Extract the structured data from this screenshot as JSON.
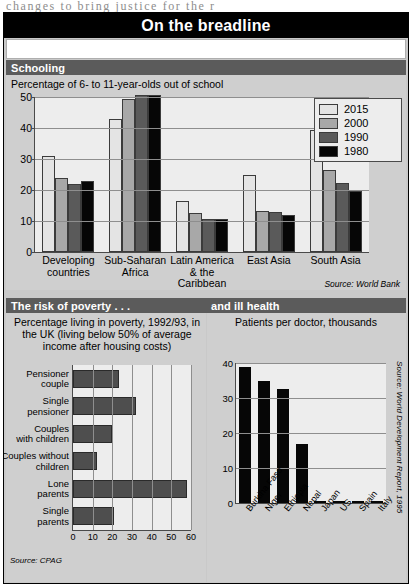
{
  "page": {
    "bleed_text": "changes to bring justice for the r"
  },
  "masthead": {
    "title": "On the breadline"
  },
  "sections": {
    "schooling": {
      "band_label": "Schooling",
      "subtitle": "Percentage of 6- to 11-year-olds out of school",
      "source": "Source: World Bank"
    },
    "poverty": {
      "band_label": "The risk of poverty . . .",
      "subtitle": "Percentage living in poverty, 1992/93, in the UK (living below 50% of average income after housing costs)",
      "source": "Source: CPAG"
    },
    "health": {
      "band_label": "and ill health",
      "subtitle": "Patients per doctor, thousands",
      "source": "Source: World Development Report, 1995"
    }
  },
  "colors": {
    "series_2015": "#e4e4e4",
    "series_2000": "#a8a8a8",
    "series_1990": "#5a5a5a",
    "series_1980": "#060606",
    "bar_dark": "#4e4e4e",
    "bar_black": "#060606",
    "band_gray": "#5b5b5b",
    "panel_gray": "#cfcfcf",
    "plot_gray": "#ededed"
  },
  "chart_data": [
    {
      "id": "schooling",
      "type": "bar",
      "title": "Percentage of 6- to 11-year-olds out of school",
      "xlabel": "",
      "ylabel": "",
      "ylim": [
        0,
        50
      ],
      "yticks": [
        0,
        10,
        20,
        30,
        40,
        50
      ],
      "grid": true,
      "legend_position": "top-right",
      "categories": [
        "Developing countries",
        "Sub-Saharan Africa",
        "Latin America & the Caribbean",
        "East Asia",
        "South Asia"
      ],
      "series": [
        {
          "name": "2015",
          "color": "#e4e4e4",
          "values": [
            31.0,
            43.0,
            16.5,
            25.0,
            39.5
          ]
        },
        {
          "name": "2000",
          "color": "#a8a8a8",
          "values": [
            23.8,
            49.5,
            12.7,
            13.2,
            26.3
          ]
        },
        {
          "name": "1990",
          "color": "#5a5a5a",
          "values": [
            21.8,
            50.5,
            10.7,
            12.8,
            22.3
          ]
        },
        {
          "name": "1980",
          "color": "#060606",
          "values": [
            22.8,
            50.5,
            10.6,
            11.8,
            19.8
          ]
        }
      ],
      "source": "Source: World Bank"
    },
    {
      "id": "poverty",
      "type": "bar",
      "orientation": "horizontal",
      "title": "Percentage living in poverty, 1992/93, in the UK (living below 50% of average income after housing costs)",
      "xlim": [
        0,
        60
      ],
      "xticks": [
        0,
        10,
        20,
        30,
        40,
        50,
        60
      ],
      "grid": true,
      "categories": [
        "Pensioner couple",
        "Single pensioner",
        "Couples with children",
        "Couples without children",
        "Lone parents",
        "Single parents"
      ],
      "values": [
        23.5,
        32.0,
        20.0,
        12.0,
        58.0,
        21.0
      ],
      "bar_color": "#4e4e4e",
      "source": "Source: CPAG"
    },
    {
      "id": "health",
      "type": "bar",
      "title": "Patients per doctor, thousands",
      "ylim": [
        0,
        40
      ],
      "yticks": [
        0,
        10,
        20,
        30,
        40
      ],
      "grid": true,
      "categories": [
        "Burkina Faso",
        "Niger",
        "Ethiopia",
        "Nepal",
        "Japan",
        "US",
        "Spain",
        "Italy"
      ],
      "values": [
        39.0,
        35.0,
        32.5,
        17.0,
        0.6,
        0.6,
        0.5,
        0.4
      ],
      "bar_color": "#060606",
      "source": "Source: World Development Report, 1995"
    }
  ]
}
